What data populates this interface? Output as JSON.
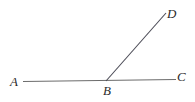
{
  "figure": {
    "background_color": "#ffffff",
    "width": 195,
    "height": 102,
    "stroke_color_horizontal": "#6b6b6b",
    "stroke_color_diagonal": "#4a4a55",
    "label_color": "#2b2b2b"
  },
  "points": {
    "a": {
      "label": "A",
      "x": 23,
      "y": 81
    },
    "b": {
      "label": "B",
      "x": 106,
      "y": 81
    },
    "c": {
      "label": "C",
      "x": 176,
      "y": 79
    },
    "d": {
      "label": "D",
      "x": 166,
      "y": 13
    }
  },
  "segments": [
    {
      "name": "segment-ac",
      "from": "A",
      "to": "C",
      "x1": 23,
      "y1": 81.5,
      "x2": 176,
      "y2": 79.5
    },
    {
      "name": "segment-bd",
      "from": "B",
      "to": "D",
      "x1": 106,
      "y1": 81,
      "x2": 166,
      "y2": 13
    }
  ]
}
